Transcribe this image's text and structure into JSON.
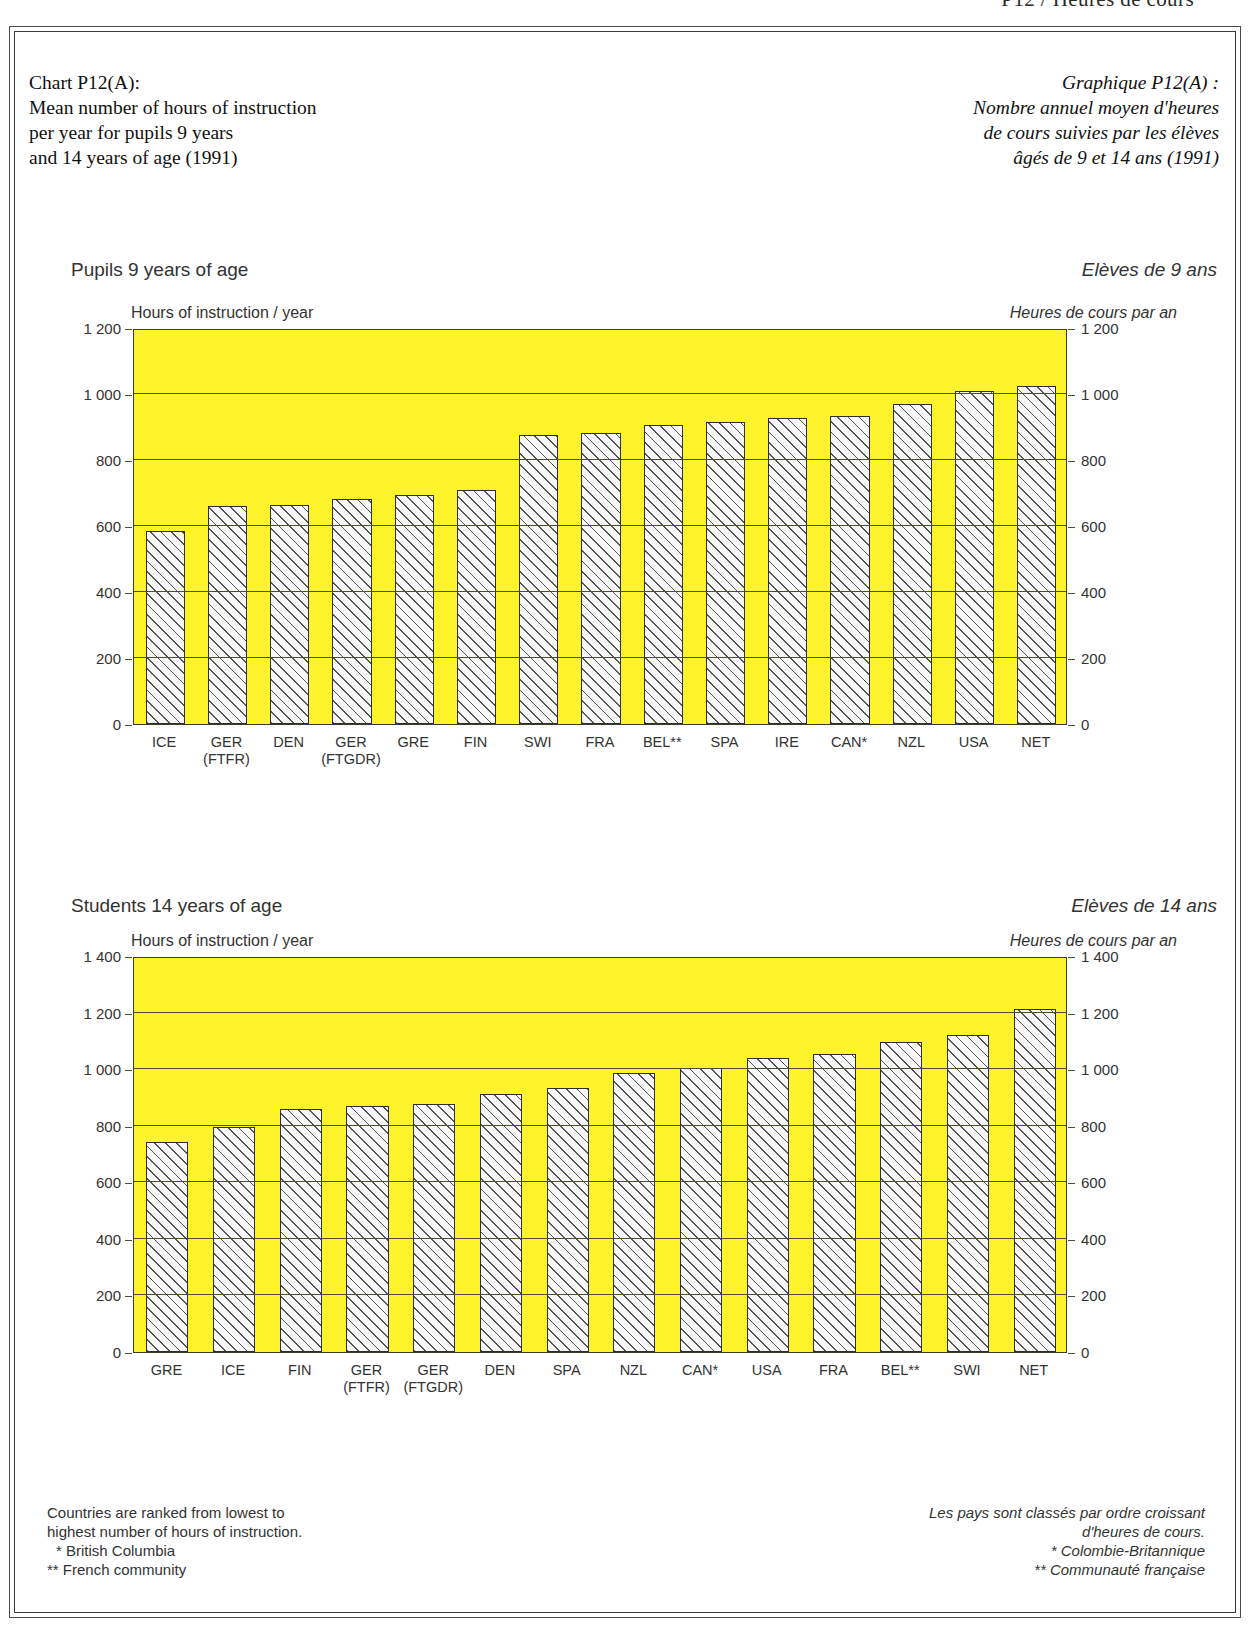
{
  "page_top_partial": "P12 / Heures de cours",
  "header": {
    "en_lines": [
      "Chart P12(A):",
      "Mean number of hours of instruction",
      "per year for pupils 9 years",
      "and 14 years of age (1991)"
    ],
    "fr_lines": [
      "Graphique P12(A) :",
      "Nombre annuel moyen d'heures",
      "de cours suivies par les élèves",
      "âgés de 9 et 14 ans (1991)"
    ]
  },
  "panel_9": {
    "title_en": "Pupils 9 years of age",
    "title_fr": "Elèves de 9 ans",
    "axis_title_en": "Hours of instruction / year",
    "axis_title_fr": "Heures de cours par an"
  },
  "panel_14": {
    "title_en": "Students 14 years of age",
    "title_fr": "Elèves de 14 ans",
    "axis_title_en": "Hours of instruction / year",
    "axis_title_fr": "Heures de cours par an"
  },
  "footnotes": {
    "en": [
      "Countries are ranked from lowest to",
      "highest number of hours of instruction.",
      "* British Columbia",
      "** French community"
    ],
    "fr": [
      "Les pays sont classés par ordre croissant",
      "d'heures de cours.",
      "* Colombie-Britannique",
      "** Communauté française"
    ]
  },
  "colors": {
    "plot_background": "#FFF32B",
    "bar_fill": "#f7f7f7",
    "bar_hatch": "#555555",
    "axis": "#3c3c2a",
    "text": "#333333"
  },
  "chart_data": [
    {
      "type": "bar",
      "id": "pupils-9-years",
      "title": "Pupils 9 years of age",
      "title_fr": "Elèves de 9 ans",
      "xlabel": "",
      "ylabel": "Hours of instruction / year",
      "ylabel_fr": "Heures de cours par an",
      "ylim": [
        0,
        1200
      ],
      "yticks": [
        0,
        200,
        400,
        600,
        800,
        1000,
        1200
      ],
      "ytick_labels": [
        "0",
        "200",
        "400",
        "600",
        "800",
        "1 000",
        "1 200"
      ],
      "grid": true,
      "legend": "none",
      "categories": [
        "ICE",
        "GER",
        "DEN",
        "GER",
        "GRE",
        "FIN",
        "SWI",
        "FRA",
        "BEL**",
        "SPA",
        "IRE",
        "CAN*",
        "NZL",
        "USA",
        "NET"
      ],
      "category_sublabels": [
        "",
        "(FTFR)",
        "",
        "(FTGDR)",
        "",
        "",
        "",
        "",
        "",
        "",
        "",
        "",
        "",
        "",
        ""
      ],
      "values": [
        585,
        662,
        665,
        682,
        695,
        708,
        876,
        883,
        905,
        916,
        927,
        932,
        969,
        1008,
        1024
      ]
    },
    {
      "type": "bar",
      "id": "students-14-years",
      "title": "Students 14 years of age",
      "title_fr": "Elèves de 14 ans",
      "xlabel": "",
      "ylabel": "Hours of instruction / year",
      "ylabel_fr": "Heures de cours par an",
      "ylim": [
        0,
        1400
      ],
      "yticks": [
        0,
        200,
        400,
        600,
        800,
        1000,
        1200,
        1400
      ],
      "ytick_labels": [
        "0",
        "200",
        "400",
        "600",
        "800",
        "1 000",
        "1 200",
        "1 400"
      ],
      "grid": true,
      "legend": "none",
      "categories": [
        "GRE",
        "ICE",
        "FIN",
        "GER",
        "GER",
        "DEN",
        "SPA",
        "NZL",
        "CAN*",
        "USA",
        "FRA",
        "BEL**",
        "SWI",
        "NET"
      ],
      "category_sublabels": [
        "",
        "",
        "",
        "(FTFR)",
        "(FTGDR)",
        "",
        "",
        "",
        "",
        "",
        "",
        "",
        "",
        ""
      ],
      "values": [
        741,
        797,
        858,
        868,
        877,
        911,
        932,
        988,
        1004,
        1040,
        1052,
        1097,
        1120,
        1212
      ]
    }
  ]
}
